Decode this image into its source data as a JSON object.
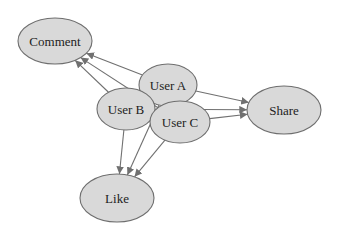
{
  "diagram": {
    "type": "directed-graph",
    "style": {
      "node_fill": "#d9d9d9",
      "node_stroke": "#6e6e6e",
      "edge_color": "#707070",
      "background": "#ffffff"
    },
    "nodes": [
      {
        "id": "comment",
        "label": "Comment",
        "cx": 55,
        "cy": 41,
        "rx": 37,
        "ry": 23
      },
      {
        "id": "user_a",
        "label": "User A",
        "cx": 168,
        "cy": 85,
        "rx": 29,
        "ry": 21
      },
      {
        "id": "user_b",
        "label": "User B",
        "cx": 126,
        "cy": 109,
        "rx": 29,
        "ry": 21
      },
      {
        "id": "user_c",
        "label": "User C",
        "cx": 180,
        "cy": 122,
        "rx": 30,
        "ry": 21
      },
      {
        "id": "share",
        "label": "Share",
        "cx": 284,
        "cy": 110,
        "rx": 37,
        "ry": 24
      },
      {
        "id": "like",
        "label": "Like",
        "cx": 117,
        "cy": 198,
        "rx": 37,
        "ry": 24
      }
    ],
    "edges": [
      {
        "from": "user_a",
        "to": "comment"
      },
      {
        "from": "user_b",
        "to": "comment"
      },
      {
        "from": "user_c",
        "to": "comment"
      },
      {
        "from": "user_a",
        "to": "share"
      },
      {
        "from": "user_b",
        "to": "share"
      },
      {
        "from": "user_c",
        "to": "share"
      },
      {
        "from": "user_b",
        "to": "like"
      },
      {
        "from": "user_a",
        "to": "like"
      },
      {
        "from": "user_c",
        "to": "like"
      }
    ]
  }
}
